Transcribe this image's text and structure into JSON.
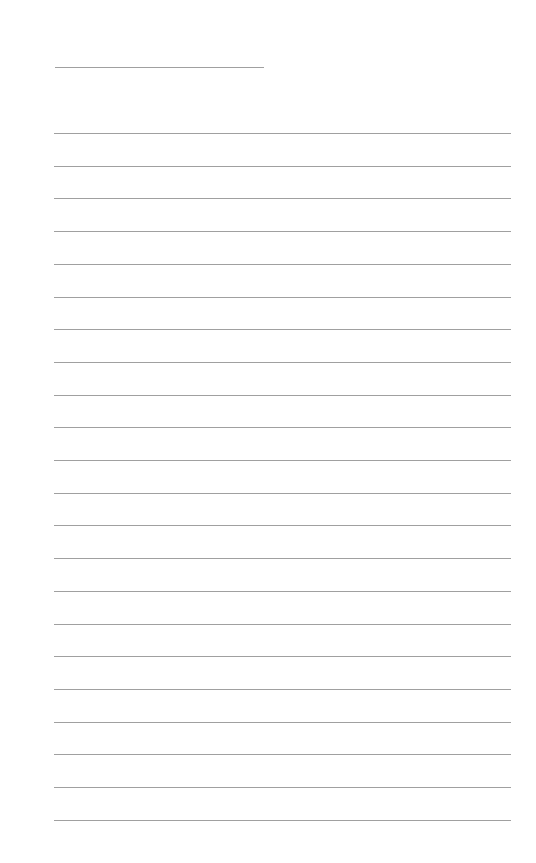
{
  "page": {
    "type": "lined-paper",
    "line_color": "#a0a0a0",
    "title_line": {
      "x": 55,
      "y": 67,
      "width": 209
    },
    "rules": {
      "count": 22,
      "first_y": 133,
      "spacing": 32.7,
      "x": 54,
      "width": 457
    }
  }
}
